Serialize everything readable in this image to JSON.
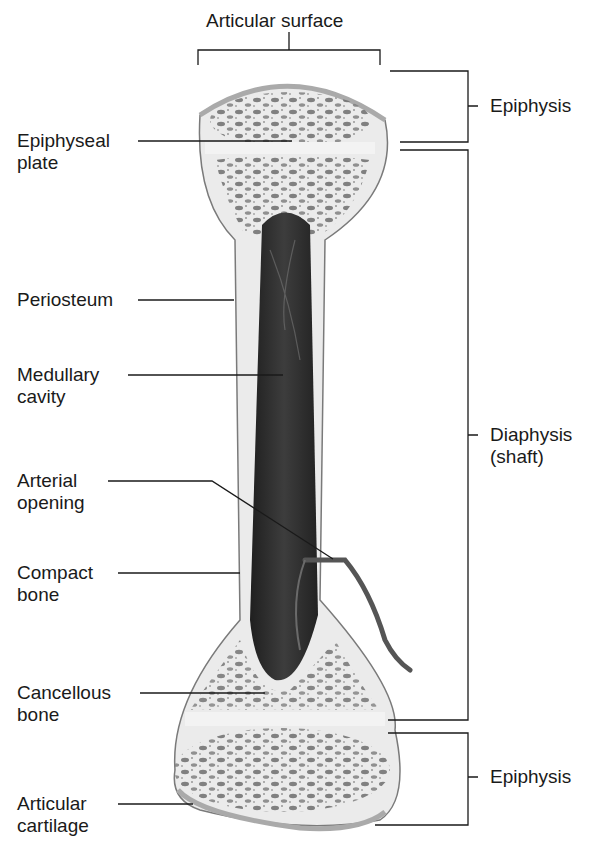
{
  "labels": {
    "articular_surface": "Articular surface",
    "epiphysis_top": "Epiphysis",
    "epiphyseal_plate": [
      "Epiphyseal",
      "plate"
    ],
    "periosteum": "Periosteum",
    "medullary_cavity": [
      "Medullary",
      "cavity"
    ],
    "diaphysis": [
      "Diaphysis",
      "(shaft)"
    ],
    "arterial_opening": [
      "Arterial",
      "opening"
    ],
    "compact_bone": [
      "Compact",
      "bone"
    ],
    "cancellous_bone": [
      "Cancellous",
      "bone"
    ],
    "epiphysis_bottom": "Epiphysis",
    "articular_cartilage": [
      "Articular",
      "cartilage"
    ]
  },
  "colors": {
    "bone_fill": "#ebebeb",
    "cartilage": "#f4f4f4",
    "marrow": "#2e2e2e",
    "outline": "#7a7a7a",
    "leader": "#1a1a1a"
  }
}
